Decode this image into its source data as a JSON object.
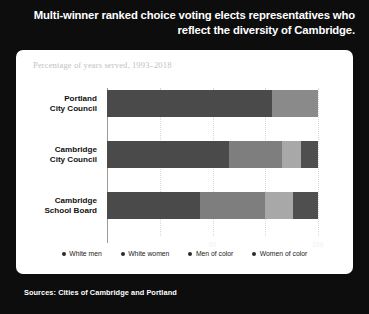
{
  "header": {
    "title": "Multi-winner ranked choice voting elects representatives who reflect the diversity of Cambridge."
  },
  "card": {
    "subtitle": "Percentage of years served, 1993–2018"
  },
  "footer": {
    "source": "Sources: Cities of Cambridge and Portland"
  },
  "colors": {
    "background": "#0d0d0d",
    "card": "#ffffff",
    "white_men": "#4a4a4a",
    "white_women": "#7e7e7e",
    "men_of_color": "#a8a8a8",
    "women_of_color": "#525252",
    "gridline": "#d9d9d9",
    "axis": "#9b9b9b",
    "subtitle": "#c2c2c2"
  },
  "legend": {
    "items": [
      {
        "label": "White men",
        "color": "#2b2b2b"
      },
      {
        "label": "White women",
        "color": "#2b2b2b"
      },
      {
        "label": "Men of color",
        "color": "#2b2b2b"
      },
      {
        "label": "Women of color",
        "color": "#2b2b2b"
      }
    ]
  },
  "chart_data": {
    "type": "bar",
    "orientation": "horizontal",
    "stacked": true,
    "stack_mode": "percent",
    "title": "Multi-winner ranked choice voting elects representatives who reflect the diversity of Cambridge.",
    "subtitle": "Percentage of years served, 1993–2018",
    "xlabel": "",
    "ylabel": "",
    "xlim": [
      0,
      100
    ],
    "xticks": [
      0,
      50,
      100
    ],
    "xtick_labels": [
      "0",
      "50",
      "100"
    ],
    "grid": true,
    "legend_position": "bottom",
    "categories": [
      "Portland City Council",
      "Cambridge City Council",
      "Cambridge School Board"
    ],
    "series": [
      {
        "name": "White men",
        "color": "#4a4a4a",
        "values": [
          78,
          58,
          44
        ]
      },
      {
        "name": "White women",
        "color": "#7e7e7e",
        "values": [
          22,
          25,
          31
        ]
      },
      {
        "name": "Men of color",
        "color": "#a8a8a8",
        "values": [
          0,
          9,
          13
        ]
      },
      {
        "name": "Women of color",
        "color": "#525252",
        "values": [
          0,
          8,
          12
        ]
      }
    ],
    "bars": [
      {
        "category": "Portland City Council",
        "label_lines": [
          "Portland",
          "City Council"
        ],
        "segments": [
          {
            "name": "White men",
            "value": 78,
            "color": "#4a4a4a"
          },
          {
            "name": "White women",
            "value": 22,
            "color": "#8a8a8a"
          }
        ]
      },
      {
        "category": "Cambridge City Council",
        "label_lines": [
          "Cambridge",
          "City Council"
        ],
        "segments": [
          {
            "name": "White men",
            "value": 58,
            "color": "#4a4a4a"
          },
          {
            "name": "White women",
            "value": 25,
            "color": "#7e7e7e"
          },
          {
            "name": "Men of color",
            "value": 9,
            "color": "#a8a8a8"
          },
          {
            "name": "Women of color",
            "value": 8,
            "color": "#4f4f4f"
          }
        ]
      },
      {
        "category": "Cambridge School Board",
        "label_lines": [
          "Cambridge",
          "School Board"
        ],
        "segments": [
          {
            "name": "White men",
            "value": 44,
            "color": "#4a4a4a"
          },
          {
            "name": "White women",
            "value": 31,
            "color": "#7e7e7e"
          },
          {
            "name": "Men of color",
            "value": 13,
            "color": "#a8a8a8"
          },
          {
            "name": "Women of color",
            "value": 12,
            "color": "#4f4f4f"
          }
        ]
      }
    ]
  }
}
